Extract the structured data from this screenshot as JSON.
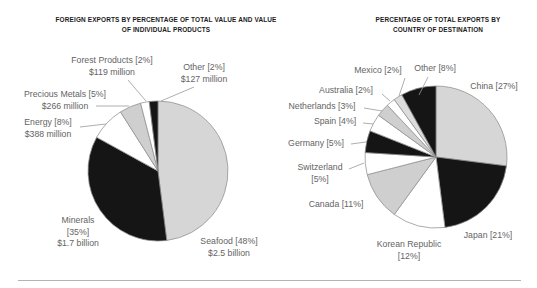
{
  "page": {
    "background": "#ffffff"
  },
  "colors": {
    "black_wedge": "#151515",
    "light_gray_wedge": "#d6d6d6",
    "mid_gray_wedge": "#cfcfcf",
    "white_wedge": "#ffffff",
    "wedge_outline": "#8f8f8f",
    "label_text": "#646464",
    "title_text": "#1b1b1b",
    "leader_line": "#999999",
    "bottom_rule": "#b3b3b3"
  },
  "chart_data": [
    {
      "type": "pie",
      "title": "FOREIGN EXPORTS BY PERCENTAGE OF TOTAL VALUE AND VALUE OF INDIVIDUAL PRODUCTS",
      "title_lines": [
        "FOREIGN EXPORTS BY PERCENTAGE OF TOTAL VALUE AND VALUE",
        "OF INDIVIDUAL PRODUCTS"
      ],
      "direction": "clockwise",
      "start_angle_deg": 0,
      "legend": "none",
      "label_style": "callout",
      "segments": [
        {
          "label": "Seafood",
          "pct": 48,
          "pct_text": "[48%]",
          "label_text": "Seafood [48%]",
          "value_text": "$2.5 billion",
          "color": "#d6d6d6"
        },
        {
          "label": "Minerals",
          "pct": 35,
          "pct_text": "[35%]",
          "label_text": "Minerals [35%]",
          "value_text": "$1.7 billion",
          "color": "#151515"
        },
        {
          "label": "Energy",
          "pct": 8,
          "pct_text": "[8%]",
          "label_text": "Energy [8%]",
          "value_text": "$388 million",
          "color": "#ffffff"
        },
        {
          "label": "Precious Metals",
          "pct": 5,
          "pct_text": "[5%]",
          "label_text": "Precious Metals [5%]",
          "value_text": "$266 million",
          "color": "#cfcfcf"
        },
        {
          "label": "Forest Products",
          "pct": 2,
          "pct_text": "[2%]",
          "label_text": "Forest Products [2%]",
          "value_text": "$119 million",
          "color": "#ffffff"
        },
        {
          "label": "Other",
          "pct": 2,
          "pct_text": "[2%]",
          "label_text": "Other [2%]",
          "value_text": "$127 million",
          "color": "#151515"
        }
      ]
    },
    {
      "type": "pie",
      "title": "PERCENTAGE OF TOTAL EXPORTS BY COUNTRY OF DESTINATION",
      "title_lines": [
        "PERCENTAGE OF TOTAL EXPORTS BY",
        "COUNTRY OF DESTINATION"
      ],
      "direction": "clockwise",
      "start_angle_deg": 0,
      "legend": "none",
      "label_style": "callout",
      "segments": [
        {
          "label": "China",
          "pct": 27,
          "pct_text": "[27%]",
          "label_text": "China [27%]",
          "color": "#d6d6d6"
        },
        {
          "label": "Japan",
          "pct": 21,
          "pct_text": "[21%]",
          "label_text": "Japan [21%]",
          "color": "#151515"
        },
        {
          "label": "Korean Republic",
          "pct": 12,
          "pct_text": "[12%]",
          "label_text": "Korean Republic [12%]",
          "color": "#ffffff"
        },
        {
          "label": "Canada",
          "pct": 11,
          "pct_text": "[11%]",
          "label_text": "Canada [11%]",
          "color": "#cfcfcf"
        },
        {
          "label": "Switzerland",
          "pct": 5,
          "pct_text": "[5%]",
          "label_text": "Switzerland [5%]",
          "color": "#ffffff"
        },
        {
          "label": "Germany",
          "pct": 5,
          "pct_text": "[5%]",
          "label_text": "Germany [5%]",
          "color": "#151515"
        },
        {
          "label": "Spain",
          "pct": 4,
          "pct_text": "[4%]",
          "label_text": "Spain [4%]",
          "color": "#ffffff"
        },
        {
          "label": "Netherlands",
          "pct": 3,
          "pct_text": "[3%]",
          "label_text": "Netherlands [3%]",
          "color": "#cfcfcf"
        },
        {
          "label": "Australia",
          "pct": 2,
          "pct_text": "[2%]",
          "label_text": "Australia [2%]",
          "color": "#ffffff"
        },
        {
          "label": "Mexico",
          "pct": 2,
          "pct_text": "[2%]",
          "label_text": "Mexico [2%]",
          "color": "#dddddd"
        },
        {
          "label": "Other",
          "pct": 8,
          "pct_text": "[8%]",
          "label_text": "Other [8%]",
          "color": "#151515"
        }
      ]
    }
  ]
}
